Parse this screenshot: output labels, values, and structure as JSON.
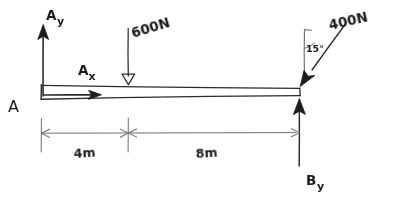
{
  "diagram": {
    "type": "statics-free-body-diagram",
    "background_color": "#ffffff",
    "ink_color": "#2b2b2b",
    "dimension_color": "#6f6f6f",
    "support_point_label": "A",
    "beam": {
      "left_x": 41,
      "right_x": 300,
      "total_length_label": "12m"
    },
    "reactions": {
      "ay": {
        "label": "Ay",
        "label_main": "A",
        "label_sub": "y",
        "direction": "up",
        "arrowhead": "solid",
        "x": 43,
        "tail_y": 95,
        "tip_y": 26
      },
      "ax": {
        "label": "Ax",
        "label_main": "A",
        "label_sub": "x",
        "direction": "right",
        "arrowhead": "solid",
        "y": 95,
        "tail_x": 43,
        "tip_x": 101
      },
      "by": {
        "label": "By",
        "label_main": "B",
        "label_sub": "y",
        "direction": "up",
        "arrowhead": "solid",
        "x": 299,
        "tail_y": 166,
        "tip_y": 100
      }
    },
    "loads": [
      {
        "label": "600N",
        "magnitude": 600,
        "unit": "N",
        "direction": "down",
        "angle_from_vertical_deg": 0,
        "arrowhead": "open",
        "x": 128,
        "tail_y": 28,
        "tip_y": 84
      },
      {
        "label": "400N",
        "magnitude": 400,
        "unit": "N",
        "direction": "down-left",
        "angle_from_vertical_deg": 15,
        "angle_label": "15°",
        "arrowhead": "solid",
        "tail_x": 344,
        "tail_y": 25,
        "tip_x": 300,
        "tip_y": 86
      }
    ],
    "dimensions": {
      "line_y": 133,
      "segments": [
        {
          "label": "4m",
          "value": 4,
          "unit": "m",
          "from_x": 41,
          "to_x": 128
        },
        {
          "label": "8m",
          "value": 8,
          "unit": "m",
          "from_x": 128,
          "to_x": 300
        }
      ]
    }
  }
}
